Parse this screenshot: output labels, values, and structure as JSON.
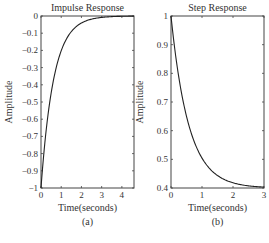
{
  "chart_data": [
    {
      "type": "line",
      "title": "Impulse Response",
      "xlabel": "Time(seconds)",
      "ylabel": "Amplitude",
      "caption": "(a)",
      "xlim": [
        0,
        4.6
      ],
      "ylim": [
        -1,
        0
      ],
      "xticks": [
        "0",
        "1",
        "2",
        "3",
        "4"
      ],
      "yticks": [
        "0",
        "−0.1",
        "−0.2",
        "−0.3",
        "−0.4",
        "−0.5",
        "−0.6",
        "−0.7",
        "−0.8",
        "−0.9",
        "−1"
      ],
      "grid": false,
      "series": [
        {
          "name": "impulse",
          "x": [
            0,
            0.25,
            0.5,
            0.75,
            1.0,
            1.25,
            1.5,
            2.0,
            2.5,
            3.0,
            3.5,
            4.0,
            4.6
          ],
          "values": [
            -1,
            -0.67,
            -0.45,
            -0.3,
            -0.2,
            -0.14,
            -0.09,
            -0.04,
            -0.02,
            -0.01,
            0,
            0,
            0
          ]
        }
      ]
    },
    {
      "type": "line",
      "title": "Step Response",
      "xlabel": "Time(seconds)",
      "ylabel": "Amplitude",
      "caption": "(b)",
      "xlim": [
        0,
        3
      ],
      "ylim": [
        0.4,
        1
      ],
      "xticks": [
        "0",
        "1",
        "2",
        "3"
      ],
      "yticks": [
        "1",
        "0.9",
        "0.8",
        "0.7",
        "0.6",
        "0.5",
        "0.4"
      ],
      "grid": false,
      "series": [
        {
          "name": "step",
          "x": [
            0,
            0.25,
            0.5,
            0.75,
            1.0,
            1.25,
            1.5,
            2.0,
            2.5,
            3.0
          ],
          "values": [
            1,
            0.79,
            0.66,
            0.57,
            0.51,
            0.47,
            0.45,
            0.42,
            0.41,
            0.4
          ]
        }
      ]
    }
  ]
}
